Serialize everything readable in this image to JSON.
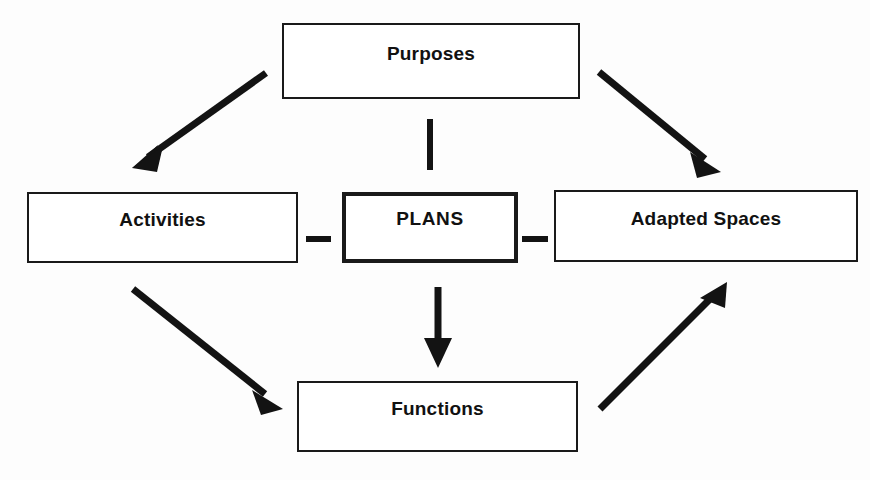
{
  "diagram": {
    "background_color": "#fdfdfd",
    "line_color": "#131313",
    "box_border_color": "#1a1a1a",
    "nodes": [
      {
        "id": "purposes",
        "label": "Purposes",
        "emphasis": false
      },
      {
        "id": "activities",
        "label": "Activities",
        "emphasis": false
      },
      {
        "id": "plans",
        "label": "PLANS",
        "emphasis": true
      },
      {
        "id": "adapted_spaces",
        "label": "Adapted Spaces",
        "emphasis": false
      },
      {
        "id": "functions",
        "label": "Functions",
        "emphasis": false
      }
    ],
    "connectors": [
      {
        "id": "purposes-to-activities",
        "from": "purposes",
        "to": "activities",
        "style": "arrow",
        "label": ""
      },
      {
        "id": "purposes-to-adapted-spaces",
        "from": "purposes",
        "to": "adapted_spaces",
        "style": "arrow",
        "label": ""
      },
      {
        "id": "purposes-to-plans",
        "from": "purposes",
        "to": "plans",
        "style": "line",
        "label": ""
      },
      {
        "id": "plans-to-functions",
        "from": "plans",
        "to": "functions",
        "style": "arrow",
        "label": ""
      },
      {
        "id": "activities-to-functions",
        "from": "activities",
        "to": "functions",
        "style": "arrow",
        "label": ""
      },
      {
        "id": "functions-to-adapted-spaces",
        "from": "functions",
        "to": "adapted_spaces",
        "style": "arrow",
        "label": ""
      },
      {
        "id": "activities-plans-link",
        "from": "activities",
        "to": "plans",
        "style": "dash",
        "label": ""
      },
      {
        "id": "plans-adapted-spaces-link",
        "from": "plans",
        "to": "adapted_spaces",
        "style": "dash",
        "label": ""
      }
    ]
  }
}
